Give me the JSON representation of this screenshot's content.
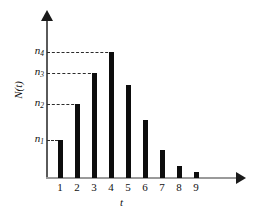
{
  "chart_data": {
    "type": "bar",
    "title": "",
    "xlabel": "t",
    "ylabel": "N(t)",
    "categories": [
      "1",
      "2",
      "3",
      "4",
      "5",
      "6",
      "7",
      "8",
      "9"
    ],
    "values": [
      38,
      74,
      105,
      126,
      93,
      58,
      28,
      12,
      6
    ],
    "ylim": [
      0,
      158
    ],
    "xlim": [
      0,
      10
    ],
    "grid": false,
    "legend": null,
    "bar_color": "#0d0d0d",
    "axis_color": "#5a5a5a",
    "guide_color": "#2b2b2b",
    "background": "#ffffff",
    "y_tick_labels": [
      {
        "text": "n",
        "sub": "1",
        "value": 38
      },
      {
        "text": "n",
        "sub": "2",
        "value": 74
      },
      {
        "text": "n",
        "sub": "3",
        "value": 105
      },
      {
        "text": "n",
        "sub": "4",
        "value": 126
      }
    ],
    "guides": [
      {
        "label": "n1",
        "value": 38,
        "to_category": "1"
      },
      {
        "label": "n2",
        "value": 74,
        "to_category": "2"
      },
      {
        "label": "n3",
        "value": 105,
        "to_category": "3"
      },
      {
        "label": "n4",
        "value": 126,
        "to_category": "4"
      }
    ],
    "annotations": []
  }
}
